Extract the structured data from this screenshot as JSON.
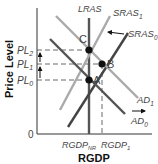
{
  "diagram": {
    "y_axis_label": "Price Level",
    "x_axis_label": "RGDP",
    "origin_label": "0",
    "price_levels": [
      {
        "id": "PL2",
        "base": "PL",
        "sub": "2"
      },
      {
        "id": "PL1",
        "base": "PL",
        "sub": "1"
      },
      {
        "id": "PL0",
        "base": "PL",
        "sub": "0"
      }
    ],
    "output_levels": [
      {
        "id": "RGDPNR",
        "base": "RGDP",
        "sub": "NR"
      },
      {
        "id": "RGDP1",
        "base": "RGDP",
        "sub": "1"
      }
    ],
    "curves": {
      "lras": {
        "label": "LRAS",
        "color": "#555555"
      },
      "sras1": {
        "base": "SRAS",
        "sub": "1",
        "color": "#aaaaaa"
      },
      "sras0": {
        "base": "SRAS",
        "sub": "0",
        "color": "#444444"
      },
      "ad1": {
        "base": "AD",
        "sub": "1",
        "color": "#aaaaaa"
      },
      "ad0": {
        "base": "AD",
        "sub": "0",
        "color": "#555555"
      }
    },
    "points": [
      {
        "label": "C",
        "at": [
          "RGDPNR",
          "PL2"
        ]
      },
      {
        "label": "B",
        "at": [
          "RGDP1",
          "PL1"
        ]
      },
      {
        "label": "A",
        "at": [
          "RGDPNR",
          "PL0"
        ]
      }
    ],
    "annotations": {
      "sras_shift": "left",
      "ad_shift": "right",
      "price_arrows": [
        "PL0→PL1",
        "PL1→PL2"
      ]
    }
  }
}
